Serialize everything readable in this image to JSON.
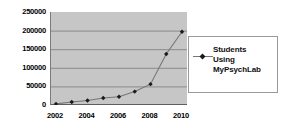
{
  "chart_data": {
    "type": "line",
    "title": "",
    "xlabel": "",
    "ylabel": "",
    "categories": [
      2002,
      2003,
      2004,
      2005,
      2006,
      2007,
      2008,
      2009,
      2010
    ],
    "x": [
      2002,
      2003,
      2004,
      2005,
      2006,
      2007,
      2008,
      2009,
      2010
    ],
    "series": [
      {
        "name": "Students Using MyPsychLab",
        "values": [
          3000,
          8000,
          12000,
          19000,
          22000,
          36000,
          56000,
          137000,
          197000
        ]
      }
    ],
    "ylim": [
      0,
      250000
    ],
    "xlim": [
      2002,
      2010
    ],
    "ytick_labels": [
      "0",
      "50000",
      "100000",
      "150000",
      "200000",
      "250000"
    ],
    "ytick_values": [
      0,
      50000,
      100000,
      150000,
      200000,
      250000
    ],
    "xtick_labels": [
      "2002",
      "2004",
      "2006",
      "2008",
      "2010"
    ],
    "xtick_values": [
      2002,
      2004,
      2006,
      2008,
      2010
    ],
    "grid": "horizontal",
    "legend_position": "right",
    "legend_entries": [
      "Students Using MyPsychLab"
    ],
    "colors": {
      "plot_background": "#c6c6c6",
      "gridline": "#8a8a8a",
      "line": "#767676",
      "marker": "#1a1a1a",
      "legend_background": "#ffffff",
      "legend_border": "#9a9a9a",
      "text": "#000000"
    }
  },
  "legend": {
    "entry_label": "Students\nUsing\nMyPsychLab",
    "marker_icon": "diamond-marker-icon"
  }
}
